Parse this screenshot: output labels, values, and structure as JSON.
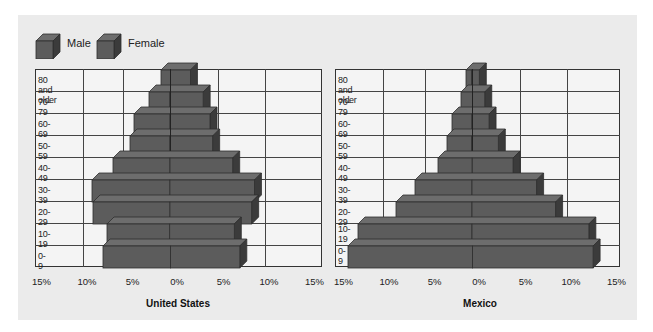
{
  "legend": [
    {
      "label": "Male",
      "color": "#5c5c5c"
    },
    {
      "label": "Female",
      "color": "#5c5c5c"
    }
  ],
  "axis_ticks": [
    "15%",
    "10%",
    "5%",
    "0%",
    "5%",
    "10%",
    "15%"
  ],
  "colors": {
    "bar_front": "#5c5c5c",
    "bar_top": "#6d6d6d",
    "bar_side": "#3b3b3b",
    "panel": "#ebebeb",
    "grid_bg": "#f4f4f4",
    "grid_line": "#444444"
  },
  "charts": [
    {
      "title": "United States"
    },
    {
      "title": "Mexico"
    }
  ],
  "chart_data": [
    {
      "type": "bar",
      "orientation": "horizontal",
      "subtype": "population-pyramid",
      "title": "United States",
      "xlabel": "",
      "ylabel": "",
      "categories": [
        "80 and older",
        "70-79",
        "60-69",
        "50-59",
        "40-49",
        "30-39",
        "20-29",
        "10-19",
        "0-9"
      ],
      "series": [
        {
          "name": "Male",
          "side": "left",
          "values": [
            1.0,
            2.2,
            3.8,
            4.2,
            6.0,
            8.2,
            8.1,
            6.6,
            7.1
          ]
        },
        {
          "name": "Female",
          "side": "right",
          "values": [
            2.1,
            3.5,
            4.2,
            4.5,
            6.6,
            8.9,
            8.6,
            6.8,
            7.3
          ]
        }
      ],
      "xlim": [
        -15,
        15
      ],
      "x_ticks": [
        "15%",
        "10%",
        "5%",
        "0%",
        "5%",
        "10%",
        "15%"
      ],
      "grid": true,
      "legend_position": "top-left"
    },
    {
      "type": "bar",
      "orientation": "horizontal",
      "subtype": "population-pyramid",
      "title": "Mexico",
      "xlabel": "",
      "ylabel": "",
      "categories": [
        "80 and older",
        "70-79",
        "60-69",
        "50-59",
        "40-49",
        "30-39",
        "20-29",
        "10-19",
        "0-9"
      ],
      "row_labels_display": [
        "80 and older",
        "70-79",
        "60-69",
        "50-59",
        "40-49",
        "30-39",
        "20-29",
        "10-\n19",
        "0-\n9"
      ],
      "series": [
        {
          "name": "Male",
          "side": "left",
          "values": [
            0.6,
            1.2,
            2.1,
            2.6,
            3.6,
            6.0,
            8.0,
            12.0,
            13.1
          ]
        },
        {
          "name": "Female",
          "side": "right",
          "values": [
            0.8,
            1.3,
            1.8,
            2.8,
            4.3,
            6.8,
            8.8,
            12.3,
            12.7
          ]
        }
      ],
      "xlim": [
        -15,
        15
      ],
      "x_ticks": [
        "15%",
        "10%",
        "5%",
        "0%",
        "5%",
        "10%",
        "15%"
      ],
      "grid": true,
      "legend_position": "top-left"
    }
  ]
}
